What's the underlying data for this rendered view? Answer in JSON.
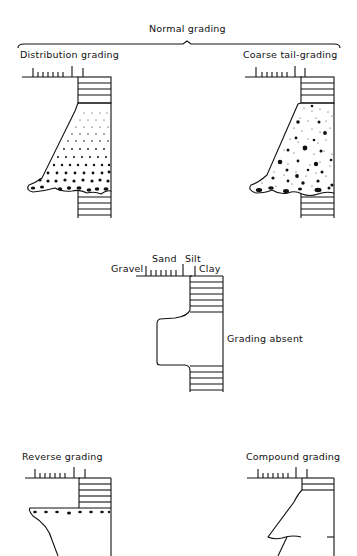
{
  "figure": {
    "title": "Normal grading",
    "panels": [
      {
        "id": "distribution",
        "label": "Distribution grading"
      },
      {
        "id": "coarse-tail",
        "label": "Coarse tail-grading"
      },
      {
        "id": "absent",
        "label": "Grading absent"
      },
      {
        "id": "reverse",
        "label": "Reverse grading"
      },
      {
        "id": "compound",
        "label": "Compound grading"
      }
    ],
    "grain_scale": {
      "labels": [
        "Gravel",
        "Sand",
        "Silt",
        "Clay"
      ]
    }
  },
  "colors": {
    "ink": "#111111",
    "background": "#ffffff"
  }
}
